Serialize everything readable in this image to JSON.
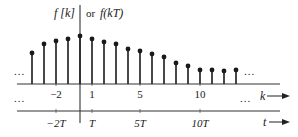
{
  "diagram": {
    "title_left": "f [k]",
    "title_sep": "or",
    "title_right": "f(kT)",
    "ellipsis": "...",
    "k_axis_label": "k",
    "t_axis_label": "t",
    "k_ticks": [
      {
        "k": -2,
        "label": "−2"
      },
      {
        "k": 1,
        "label": "1"
      },
      {
        "k": 5,
        "label": "5"
      },
      {
        "k": 10,
        "label": "10"
      }
    ],
    "t_ticks": [
      {
        "k": -2,
        "label": "−2T"
      },
      {
        "k": 1,
        "label": "T"
      },
      {
        "k": 5,
        "label": "5T"
      },
      {
        "k": 10,
        "label": "10T"
      }
    ],
    "colors": {
      "ink": "#1a1a1a",
      "axis": "#333333",
      "background": "#ffffff"
    }
  },
  "chart_data": {
    "type": "stem",
    "xlabel": "k (samples) / t (time)",
    "ylabel": "f[k]",
    "x": [
      -4,
      -3,
      -2,
      -1,
      0,
      1,
      2,
      3,
      4,
      5,
      6,
      7,
      8,
      9,
      10,
      11,
      12,
      13
    ],
    "values": [
      31,
      40,
      43,
      45,
      48,
      45,
      42,
      40,
      35,
      33,
      30,
      27,
      21,
      18,
      14,
      14,
      13,
      14
    ],
    "continues_left": true,
    "continues_right": true,
    "axes": [
      "k",
      "t"
    ],
    "sample_period": "T"
  }
}
